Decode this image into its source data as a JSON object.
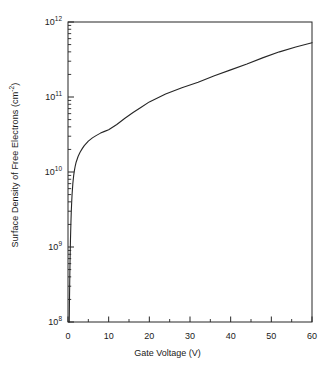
{
  "chart_data": {
    "type": "line",
    "title": "",
    "xlabel": "Gate Voltage (V)",
    "ylabel": "Surface Density of Free Electrons (cm⁻²)",
    "ylabel_base": "Surface Density of Free Electrons (cm",
    "ylabel_exp": "-2",
    "ylabel_tail": ")",
    "xlim": [
      0,
      60
    ],
    "ylim": [
      100000000.0,
      1000000000000.0
    ],
    "yscale": "log",
    "xscale": "linear",
    "grid": false,
    "legend": false,
    "xticks": [
      0,
      10,
      20,
      30,
      40,
      50,
      60
    ],
    "xtick_labels": [
      "0",
      "10",
      "20",
      "30",
      "40",
      "50",
      "60"
    ],
    "xminor_ticks": [
      5,
      15,
      25,
      35,
      45,
      55
    ],
    "yticks": [
      100000000,
      1000000000,
      10000000000,
      100000000000,
      1000000000000
    ],
    "ytick_labels": [
      "10⁸",
      "10⁹",
      "10¹⁰",
      "10¹¹",
      "10¹²"
    ],
    "ytick_mantissa": "10",
    "ytick_exponents": [
      "8",
      "9",
      "10",
      "11",
      "12"
    ],
    "series": [
      {
        "name": "surface density",
        "color": "#262626",
        "x": [
          0.3,
          0.35,
          0.4,
          0.45,
          0.5,
          0.55,
          0.6,
          0.7,
          0.8,
          0.9,
          1.0,
          1.2,
          1.4,
          1.6,
          1.8,
          2.0,
          2.5,
          3.0,
          3.5,
          4.0,
          5.0,
          6.0,
          7.0,
          8.0,
          9.0,
          10.0,
          12.0,
          14.0,
          16.0,
          18.0,
          20.0,
          24.0,
          28.0,
          32.0,
          36.0,
          40.0,
          44.0,
          48.0,
          52.0,
          56.0,
          60.0
        ],
        "y": [
          100000000.0,
          170000000.0,
          280000000.0,
          430000000.0,
          630000000.0,
          880000000.0,
          1180000000.0,
          1950000000.0,
          2900000000.0,
          3900000000.0,
          5000000000.0,
          7100000000.0,
          9000000000.0,
          10700000000.0,
          12200000000.0,
          13500000000.0,
          16200000000.0,
          18500000000.0,
          20500000000.0,
          22500000000.0,
          25800000000.0,
          28500000000.0,
          30800000000.0,
          33000000000.0,
          34800000000.0,
          36500000000.0,
          43000000000.0,
          52000000000.0,
          62000000000.0,
          73000000000.0,
          86000000000.0,
          110000000000.0,
          133000000000.0,
          157000000000.0,
          192000000000.0,
          230000000000.0,
          275000000000.0,
          335000000000.0,
          400000000000.0,
          465000000000.0,
          530000000000.0
        ]
      }
    ]
  },
  "axes": {
    "frame_color": "#262626",
    "tick_color": "#262626"
  }
}
